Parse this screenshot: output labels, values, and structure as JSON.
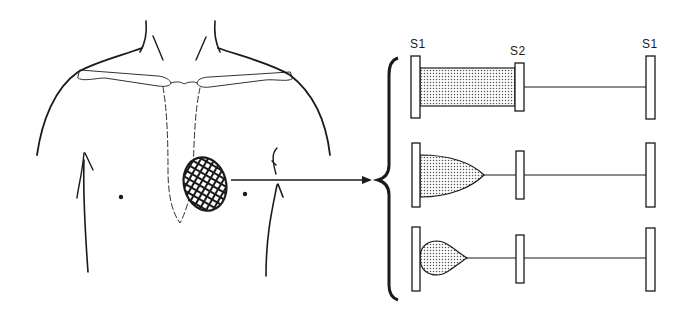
{
  "figure": {
    "type": "anatomical diagram with phonocardiogram schematics",
    "ink_color": "#1a1a1a",
    "background": "#ffffff"
  },
  "torso": {
    "description": "Anterior chest outline with clavicles, dashed sternum, nipples, and cross-hatched auscultation area at the apex",
    "auscultation_area": {
      "shape": "hatched-oval",
      "center": [
        205,
        184
      ]
    }
  },
  "arrow": {
    "from": [
      230,
      180
    ],
    "to": [
      370,
      180
    ]
  },
  "labels": {
    "s1_left": "S1",
    "s2": "S2",
    "s1_right": "S1"
  },
  "rows": [
    {
      "name": "holosystolic",
      "murmur_shape": "rectangle",
      "y_center": 87
    },
    {
      "name": "crescendo-decrescendo-early",
      "murmur_shape": "bullet",
      "y_center": 175
    },
    {
      "name": "early-decrescendo",
      "murmur_shape": "teardrop",
      "y_center": 258
    }
  ]
}
